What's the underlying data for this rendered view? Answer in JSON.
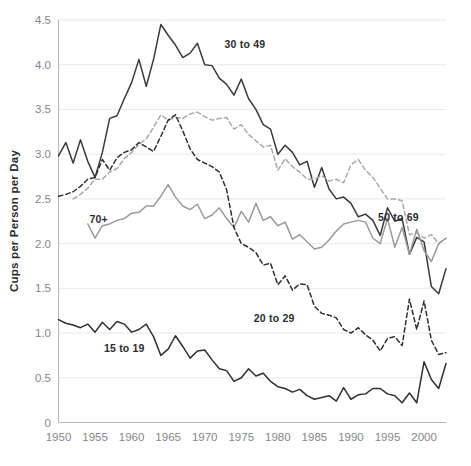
{
  "chart_data": {
    "type": "line",
    "title": "",
    "xlabel": "",
    "ylabel": "Cups per Person per Day",
    "xlim": [
      1950,
      2003
    ],
    "ylim": [
      0,
      4.5
    ],
    "grid": true,
    "legend_position": "inline-annotations",
    "x_ticks": [
      "1950",
      "1955",
      "1960",
      "1965",
      "1970",
      "1975",
      "1980",
      "1985",
      "1990",
      "1995",
      "2000"
    ],
    "x_tick_values": [
      1950,
      1955,
      1960,
      1965,
      1970,
      1975,
      1980,
      1985,
      1990,
      1995,
      2000
    ],
    "y_ticks": [
      "0",
      "0.5",
      "1.0",
      "1.5",
      "2.0",
      "2.5",
      "3.0",
      "3.5",
      "4.0",
      "4.5"
    ],
    "y_tick_values": [
      0,
      0.5,
      1.0,
      1.5,
      2.0,
      2.5,
      3.0,
      3.5,
      4.0,
      4.5
    ],
    "series": [
      {
        "name": "30 to 49",
        "label": "30 to 49",
        "color": "#3a3a3e",
        "style": "solid",
        "label_x": 1975.5,
        "label_y": 4.23,
        "x": [
          1950,
          1951,
          1952,
          1953,
          1954,
          1955,
          1956,
          1957,
          1958,
          1959,
          1960,
          1961,
          1962,
          1963,
          1964,
          1965,
          1966,
          1967,
          1968,
          1969,
          1970,
          1971,
          1972,
          1973,
          1974,
          1975,
          1976,
          1977,
          1978,
          1979,
          1980,
          1981,
          1982,
          1983,
          1984,
          1985,
          1986,
          1987,
          1988,
          1989,
          1990,
          1991,
          1992,
          1993,
          1994,
          1995,
          1996,
          1997,
          1998,
          1999,
          2000,
          2001,
          2002,
          2003
        ],
        "y": [
          2.98,
          3.13,
          2.9,
          3.16,
          2.92,
          2.74,
          3.02,
          3.4,
          3.43,
          3.62,
          3.8,
          4.06,
          3.76,
          4.06,
          4.45,
          4.33,
          4.22,
          4.08,
          4.13,
          4.24,
          4.0,
          3.99,
          3.85,
          3.78,
          3.66,
          3.84,
          3.62,
          3.5,
          3.33,
          3.28,
          3.0,
          3.1,
          3.02,
          2.88,
          2.92,
          2.63,
          2.85,
          2.61,
          2.5,
          2.52,
          2.45,
          2.3,
          2.33,
          2.26,
          2.09,
          2.4,
          2.25,
          2.28,
          1.88,
          2.07,
          2.02,
          1.52,
          1.44,
          1.72
        ]
      },
      {
        "name": "50 to 69",
        "label": "50 to 69",
        "color": "#a8a8ad",
        "style": "dashed",
        "label_x": 1996.5,
        "label_y": 2.3,
        "x": [
          1952,
          1953,
          1954,
          1955,
          1956,
          1957,
          1958,
          1959,
          1960,
          1961,
          1962,
          1963,
          1964,
          1965,
          1966,
          1967,
          1968,
          1969,
          1970,
          1971,
          1972,
          1973,
          1974,
          1975,
          1976,
          1977,
          1978,
          1979,
          1980,
          1981,
          1982,
          1983,
          1984,
          1985,
          1986,
          1987,
          1988,
          1989,
          1990,
          1991,
          1992,
          1993,
          1994,
          1995,
          1996,
          1997,
          1998,
          1999,
          2000,
          2001,
          2002,
          2003
        ],
        "y": [
          2.5,
          2.55,
          2.62,
          2.72,
          2.72,
          2.8,
          2.84,
          2.95,
          3.02,
          3.11,
          3.17,
          3.3,
          3.44,
          3.38,
          3.41,
          3.4,
          3.45,
          3.47,
          3.42,
          3.38,
          3.4,
          3.41,
          3.28,
          3.33,
          3.22,
          3.15,
          3.08,
          3.1,
          2.82,
          2.95,
          2.86,
          2.8,
          2.72,
          2.72,
          2.76,
          2.7,
          2.72,
          2.68,
          2.88,
          2.94,
          2.82,
          2.74,
          2.62,
          2.5,
          2.5,
          2.48,
          2.1,
          2.12,
          2.06,
          2.1,
          2.0,
          2.06
        ]
      },
      {
        "name": "70+",
        "label": "70+",
        "color": "#9a9a9f",
        "style": "solid",
        "label_x": 1955.5,
        "label_y": 2.28,
        "x": [
          1954,
          1955,
          1956,
          1957,
          1958,
          1959,
          1960,
          1961,
          1962,
          1963,
          1964,
          1965,
          1966,
          1967,
          1968,
          1969,
          1970,
          1971,
          1972,
          1973,
          1974,
          1975,
          1976,
          1977,
          1978,
          1979,
          1980,
          1981,
          1982,
          1983,
          1984,
          1985,
          1986,
          1987,
          1988,
          1989,
          1990,
          1991,
          1992,
          1993,
          1994,
          1995,
          1996,
          1997,
          1998,
          1999,
          2000,
          2001,
          2002,
          2003
        ],
        "y": [
          2.22,
          2.06,
          2.2,
          2.22,
          2.26,
          2.28,
          2.34,
          2.35,
          2.42,
          2.42,
          2.53,
          2.66,
          2.52,
          2.42,
          2.38,
          2.44,
          2.28,
          2.32,
          2.4,
          2.28,
          2.18,
          2.36,
          2.24,
          2.45,
          2.26,
          2.3,
          2.2,
          2.24,
          2.05,
          2.1,
          2.02,
          1.94,
          1.96,
          2.04,
          2.14,
          2.22,
          2.24,
          2.26,
          2.24,
          2.06,
          2.0,
          2.28,
          1.96,
          2.18,
          1.88,
          2.16,
          1.92,
          1.8,
          2.0,
          2.06
        ]
      },
      {
        "name": "20 to 29",
        "label": "20 to 29",
        "color": "#2f2f33",
        "style": "dashed",
        "label_x": 1979.5,
        "label_y": 1.17,
        "x": [
          1950,
          1951,
          1952,
          1953,
          1954,
          1955,
          1956,
          1957,
          1958,
          1959,
          1960,
          1961,
          1962,
          1963,
          1964,
          1965,
          1966,
          1967,
          1968,
          1969,
          1970,
          1971,
          1972,
          1973,
          1974,
          1975,
          1976,
          1977,
          1978,
          1979,
          1980,
          1981,
          1982,
          1983,
          1984,
          1985,
          1986,
          1987,
          1988,
          1989,
          1990,
          1991,
          1992,
          1993,
          1994,
          1995,
          1996,
          1997,
          1998,
          1999,
          2000,
          2001,
          2002,
          2003
        ],
        "y": [
          2.53,
          2.55,
          2.58,
          2.64,
          2.72,
          2.74,
          2.94,
          2.82,
          2.96,
          3.02,
          3.05,
          3.13,
          3.08,
          3.03,
          3.2,
          3.38,
          3.44,
          3.26,
          3.06,
          2.94,
          2.9,
          2.86,
          2.8,
          2.6,
          2.18,
          2.0,
          1.96,
          1.9,
          1.76,
          1.78,
          1.54,
          1.64,
          1.48,
          1.55,
          1.54,
          1.3,
          1.22,
          1.2,
          1.17,
          1.04,
          1.0,
          1.06,
          0.98,
          0.92,
          0.8,
          0.94,
          0.96,
          0.86,
          1.38,
          1.04,
          1.36,
          0.92,
          0.76,
          0.78
        ]
      },
      {
        "name": "15 to 19",
        "label": "15 to 19",
        "color": "#2f2f33",
        "style": "solid",
        "label_x": 1959.0,
        "label_y": 0.83,
        "x": [
          1950,
          1951,
          1952,
          1953,
          1954,
          1955,
          1956,
          1957,
          1958,
          1959,
          1960,
          1961,
          1962,
          1963,
          1964,
          1965,
          1966,
          1967,
          1968,
          1969,
          1970,
          1971,
          1972,
          1973,
          1974,
          1975,
          1976,
          1977,
          1978,
          1979,
          1980,
          1981,
          1982,
          1983,
          1984,
          1985,
          1986,
          1987,
          1988,
          1989,
          1990,
          1991,
          1992,
          1993,
          1994,
          1995,
          1996,
          1997,
          1998,
          1999,
          2000,
          2001,
          2002,
          2003
        ],
        "y": [
          1.15,
          1.11,
          1.09,
          1.06,
          1.1,
          1.01,
          1.12,
          1.04,
          1.13,
          1.1,
          1.01,
          1.04,
          1.1,
          0.96,
          0.75,
          0.82,
          0.97,
          0.85,
          0.72,
          0.8,
          0.81,
          0.7,
          0.6,
          0.58,
          0.46,
          0.5,
          0.6,
          0.52,
          0.55,
          0.46,
          0.4,
          0.38,
          0.34,
          0.37,
          0.3,
          0.26,
          0.28,
          0.3,
          0.24,
          0.39,
          0.26,
          0.31,
          0.32,
          0.38,
          0.38,
          0.32,
          0.3,
          0.22,
          0.33,
          0.22,
          0.68,
          0.48,
          0.38,
          0.66
        ]
      }
    ]
  }
}
